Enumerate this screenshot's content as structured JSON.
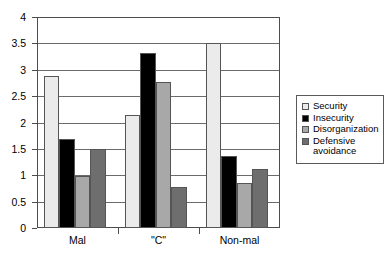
{
  "chart_data": {
    "type": "bar",
    "title": "",
    "subtitle": "",
    "xlabel": "",
    "ylabel": "",
    "categories": [
      "Mal",
      "\"C\"",
      "Non-mal"
    ],
    "series": [
      {
        "name": "Security",
        "color": "#ebebeb",
        "values": [
          2.89,
          2.14,
          3.5
        ]
      },
      {
        "name": "Insecurity",
        "color": "#000000",
        "values": [
          1.69,
          3.31,
          1.36
        ]
      },
      {
        "name": "Disorganization",
        "color": "#a8a8a8",
        "values": [
          0.98,
          2.77,
          0.85
        ]
      },
      {
        "name": "Defensive\navoidance",
        "color": "#6e6e6e",
        "values": [
          1.5,
          0.77,
          1.12
        ]
      }
    ],
    "ylim": [
      0,
      4
    ],
    "ytick_step": 0.5,
    "ytick_labels": [
      "0",
      "0.5",
      "1",
      "1.5",
      "2",
      "2.5",
      "3",
      "3.5",
      "4"
    ],
    "ytick_values": [
      0,
      0.5,
      1,
      1.5,
      2,
      2.5,
      3,
      3.5,
      4
    ],
    "grid": true,
    "grid_axis": "y",
    "legend_position": "right",
    "legend_entries": [
      "Security",
      "Insecurity",
      "Disorganization",
      "Defensive\navoidance"
    ],
    "bar_border_color": "#555555",
    "axis_color": "#4d4d4d",
    "background": "#ffffff"
  }
}
